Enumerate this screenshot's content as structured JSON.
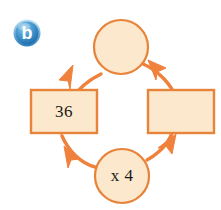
{
  "figure": {
    "label_badge": {
      "text": "b",
      "shape": "circle",
      "fill_start": "#7FC3E8",
      "fill_end": "#1E6FAF",
      "text_color": "#FFFFFF"
    },
    "palette": {
      "node_fill": "#FCE8CC",
      "node_stroke": "#E8833A",
      "arrow_color": "#F0813C",
      "text_color": "#1A1A1A",
      "background": "#FFFFFF"
    },
    "type": "cycle-flow-diagram",
    "direction": "clockwise",
    "nodes": [
      {
        "id": "top-circle",
        "shape": "circle",
        "label": "",
        "position": "top",
        "filled_in": false
      },
      {
        "id": "right-rectangle",
        "shape": "rectangle",
        "label": "",
        "position": "right",
        "filled_in": false
      },
      {
        "id": "bottom-circle",
        "shape": "circle",
        "label": "x 4",
        "position": "bottom",
        "filled_in": true
      },
      {
        "id": "left-rectangle",
        "shape": "rectangle",
        "label": "36",
        "position": "left",
        "filled_in": true
      }
    ],
    "arrows": [
      {
        "id": "arrow-left-to-top",
        "from": "left-rectangle",
        "to": "top-circle",
        "direction": "up-right"
      },
      {
        "id": "arrow-top-to-right",
        "from": "top-circle",
        "to": "right-rectangle",
        "direction": "down-right"
      },
      {
        "id": "arrow-right-to-bottom",
        "from": "right-rectangle",
        "to": "bottom-circle",
        "direction": "down-left"
      },
      {
        "id": "arrow-bottom-to-left",
        "from": "bottom-circle",
        "to": "left-rectangle",
        "direction": "up-left"
      }
    ]
  }
}
